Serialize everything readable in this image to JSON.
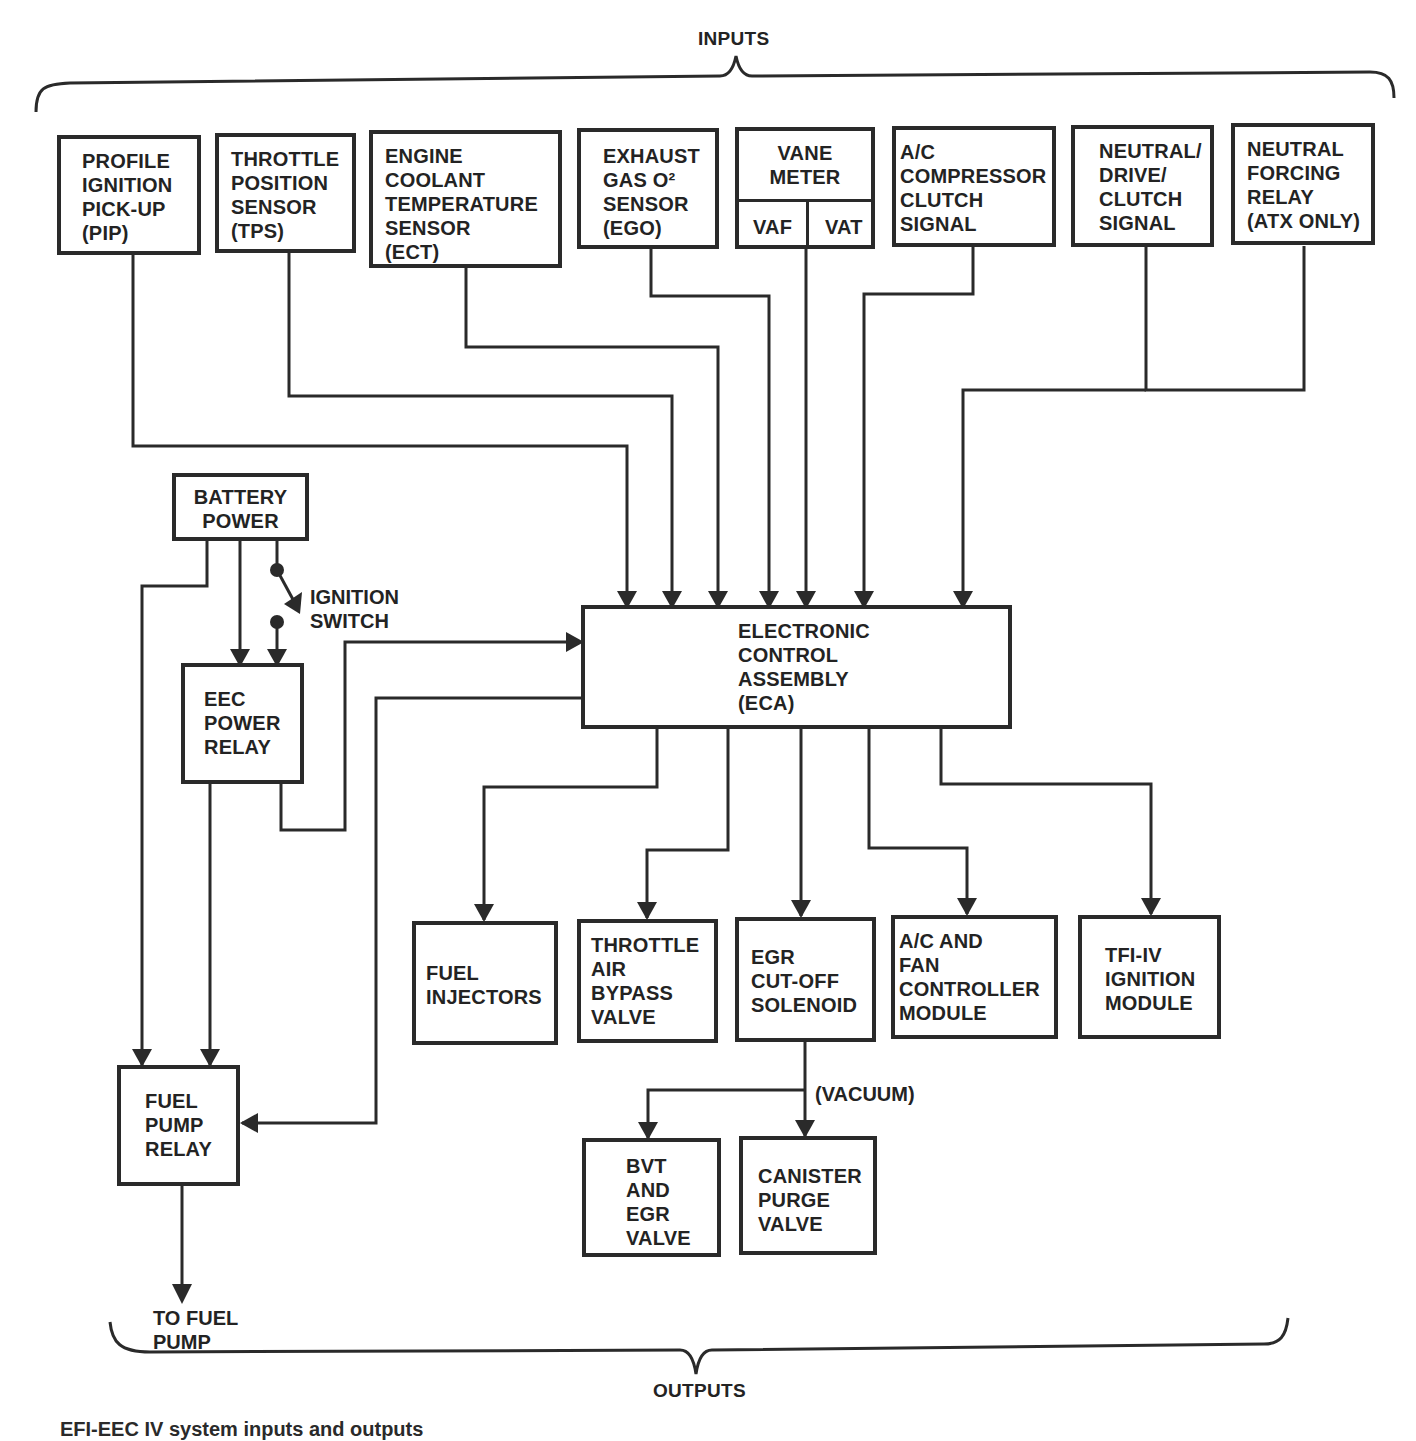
{
  "headers": {
    "inputs": "INPUTS",
    "outputs": "OUTPUTS"
  },
  "inputs": {
    "pip": "PROFILE\nIGNITION\nPICK-UP\n(PIP)",
    "tps": "THROTTLE\nPOSITION\nSENSOR\n(TPS)",
    "ect": "ENGINE\nCOOLANT\nTEMPERATURE\nSENSOR\n(ECT)",
    "ego": "EXHAUST\nGAS O²\nSENSOR\n(EGO)",
    "vane_meter": {
      "title": "VANE\nMETER",
      "vaf": "VAF",
      "vat": "VAT"
    },
    "ac_clutch": "A/C\nCOMPRESSOR\nCLUTCH\nSIGNAL",
    "ndc": "NEUTRAL/\nDRIVE/\nCLUTCH\nSIGNAL",
    "nfr": "NEUTRAL\nFORCING\nRELAY\n(ATX ONLY)"
  },
  "power": {
    "battery": "BATTERY\nPOWER",
    "ignition_switch": "IGNITION\nSWITCH",
    "eec_relay": "EEC\nPOWER\nRELAY",
    "fuel_pump_relay": "FUEL\nPUMP\nRELAY",
    "to_fuel_pump": "TO FUEL\nPUMP"
  },
  "eca": "ELECTRONIC\nCONTROL\nASSEMBLY\n(ECA)",
  "outputs": {
    "fuel_injectors": "FUEL\nINJECTORS",
    "tab_valve": "THROTTLE\nAIR\nBYPASS\nVALVE",
    "egr_solenoid": "EGR\nCUT-OFF\nSOLENOID",
    "ac_fan": "A/C AND\nFAN\nCONTROLLER\nMODULE",
    "tfi": "TFI-IV\nIGNITION\nMODULE",
    "vacuum_label": "(VACUUM)",
    "bvt_egr": "BVT\nAND\nEGR\nVALVE",
    "canister": "CANISTER\nPURGE\nVALVE"
  },
  "caption": "EFI-EEC IV system inputs and outputs",
  "colors": {
    "ink": "#2a2a2a",
    "paper": "#ffffff"
  }
}
